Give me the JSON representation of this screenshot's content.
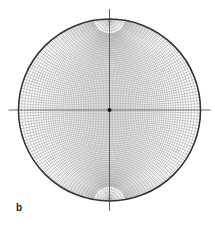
{
  "figure": {
    "panel_label": "b",
    "type": "Wulff stereographic net (equal-angle)",
    "center": [
      109.5,
      110
    ],
    "radius": 91,
    "grid_interval_deg": 2,
    "polar_cutoff_deg": 80,
    "axis_extension_px": 10,
    "center_dot": true,
    "colors": {
      "primitive": "#333333",
      "grid": "#9a9a9a",
      "axes": "#555555",
      "dot": "#111111"
    }
  }
}
